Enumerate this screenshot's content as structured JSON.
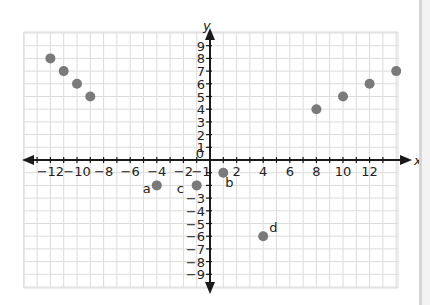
{
  "chart_data": {
    "type": "scatter",
    "title": "",
    "xlabel": "x",
    "ylabel": "y",
    "xlim": [
      -13.5,
      14
    ],
    "ylim": [
      -10,
      10
    ],
    "grid": true,
    "x_ticks": [
      -12,
      -10,
      -8,
      -6,
      -4,
      -2,
      2,
      4,
      6,
      8,
      10,
      12
    ],
    "x_tick_extra": [
      "-1"
    ],
    "y_ticks": [
      9,
      8,
      7,
      6,
      5,
      4,
      3,
      2,
      1,
      -3,
      -4,
      -5,
      -6,
      -7,
      -8,
      -9
    ],
    "origin_label": "0",
    "series": [
      {
        "name": "points",
        "color": "#7a7a7a",
        "points": [
          {
            "x": -12,
            "y": 8,
            "label": ""
          },
          {
            "x": -11,
            "y": 7,
            "label": ""
          },
          {
            "x": -10,
            "y": 6,
            "label": ""
          },
          {
            "x": -9,
            "y": 5,
            "label": ""
          },
          {
            "x": 8,
            "y": 4,
            "label": ""
          },
          {
            "x": 10,
            "y": 5,
            "label": ""
          },
          {
            "x": 12,
            "y": 6,
            "label": ""
          },
          {
            "x": 14,
            "y": 7,
            "label": ""
          },
          {
            "x": -4,
            "y": -2,
            "label": "a"
          },
          {
            "x": 1,
            "y": -1,
            "label": "b"
          },
          {
            "x": -1,
            "y": -2,
            "label": "c"
          },
          {
            "x": 4,
            "y": -6,
            "label": "d"
          }
        ]
      }
    ]
  },
  "colors": {
    "axis": "#1a1a1a",
    "grid": "#dcdcdc",
    "point": "#7a7a7a"
  }
}
